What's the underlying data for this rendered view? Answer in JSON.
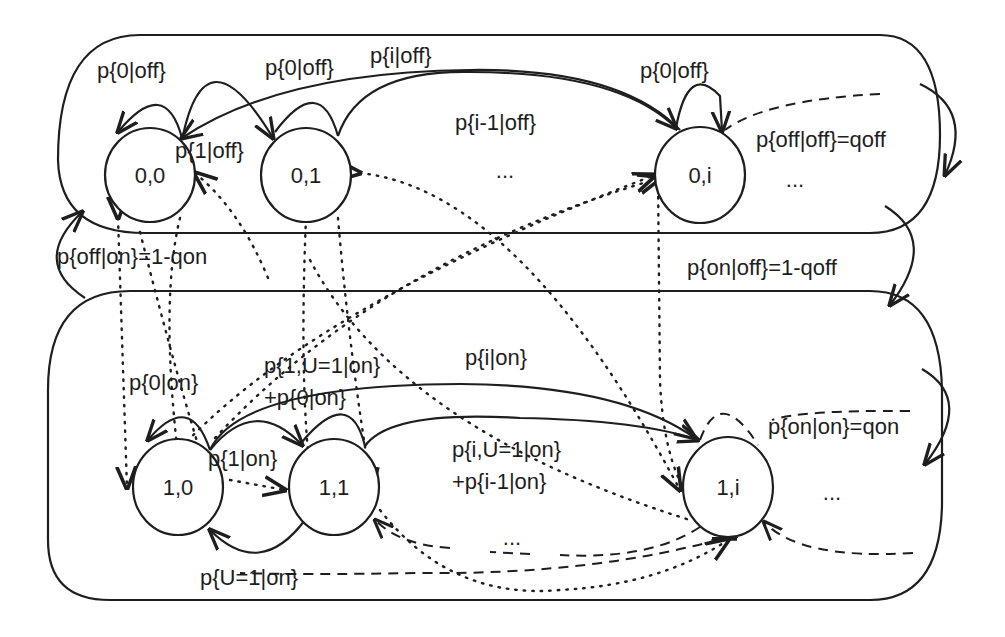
{
  "diagram": {
    "type": "markov-chain-state-diagram",
    "groups": [
      {
        "id": "off",
        "label": "off states"
      },
      {
        "id": "on",
        "label": "on states"
      }
    ],
    "nodes": [
      {
        "id": "n00",
        "label": "0,0"
      },
      {
        "id": "n01",
        "label": "0,1"
      },
      {
        "id": "n0i",
        "label": "0,i"
      },
      {
        "id": "n10",
        "label": "1,0"
      },
      {
        "id": "n11",
        "label": "1,1"
      },
      {
        "id": "n1i",
        "label": "1,i"
      }
    ],
    "ellipses": {
      "top_middle": "...",
      "top_right": "...",
      "bottom_middle": "...",
      "bottom_right": "..."
    },
    "edge_labels": {
      "p0off_self00": "p{0|off}",
      "p0off_00_to_01": "p{0|off}",
      "pioff": "p{i|off}",
      "p1off": "p{1|off}",
      "pim1off": "p{i-1|off}",
      "p0off_self0i": "p{0|off}",
      "poffoff": "p{off|off}=qoff",
      "poffon": "p{off|on}=1-qon",
      "ponoff": "p{on|off}=1-qoff",
      "p0on": "p{0|on}",
      "p1U1on_line1": "p{1,U=1|on}",
      "p1U1on_line2": "+p{0|on}",
      "pion": "p{i|on}",
      "p1on": "p{1|on}",
      "piU1on_line1": "p{i,U=1|on}",
      "piU1on_line2": "+p{i-1|on}",
      "ponon": "p{on|on}=qon",
      "pU1on": "p{U=1|on}"
    },
    "edges": [
      {
        "from": "0,0",
        "to": "0,0",
        "label": "p{0|off}",
        "style": "solid"
      },
      {
        "from": "0,0",
        "to": "0,1",
        "label": "p{0|off}",
        "style": "solid"
      },
      {
        "from": "0,i",
        "to": "0,0",
        "label": "p{i|off}",
        "style": "solid"
      },
      {
        "from": "0,1",
        "to": "0,i",
        "label": "p{i-1|off}",
        "style": "solid"
      },
      {
        "from": "0,i",
        "to": "0,i",
        "label": "p{0|off}",
        "style": "solid"
      },
      {
        "from": "off",
        "to": "off",
        "label": "p{off|off}=qoff",
        "style": "solid"
      },
      {
        "from": "on",
        "to": "off",
        "label": "p{off|on}=1-qon",
        "style": "solid"
      },
      {
        "from": "off",
        "to": "on",
        "label": "p{on|off}=1-qoff",
        "style": "solid"
      },
      {
        "from": "1,0",
        "to": "1,0",
        "label": "p{0|on}",
        "style": "solid"
      },
      {
        "from": "1,0",
        "to": "1,1",
        "label": "p{1,U=1|on}+p{0|on}",
        "style": "solid"
      },
      {
        "from": "1,0",
        "to": "1,i",
        "label": "p{i|on}",
        "style": "solid"
      },
      {
        "from": "1,1",
        "to": "1,i",
        "label": "p{i,U=1|on}+p{i-1|on}",
        "style": "solid"
      },
      {
        "from": "1,1",
        "to": "1,0",
        "label": "p{U=1|on}",
        "style": "solid"
      },
      {
        "from": "on",
        "to": "on",
        "label": "p{on|on}=qon",
        "style": "solid"
      }
    ]
  }
}
